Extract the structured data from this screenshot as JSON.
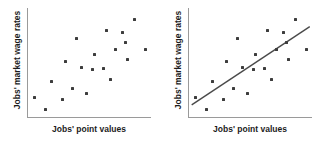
{
  "figure": {
    "background_color": "#ffffff",
    "axis_color": "#9a9a9a",
    "marker_color": "#3d3d3d",
    "trendline_color": "#4a4a4a"
  },
  "panels": [
    {
      "name": "scatter-without-trendline",
      "xlabel": "Jobs' point values",
      "ylabel": "Jobs' market wage rates",
      "has_trendline": false
    },
    {
      "name": "scatter-with-trendline",
      "xlabel": "Jobs' point values",
      "ylabel": "Jobs' market wage rates",
      "has_trendline": true
    }
  ],
  "chart_data": [
    {
      "type": "scatter",
      "title": "",
      "xlabel": "Jobs' point values",
      "ylabel": "Jobs' market wage rates",
      "xlim": [
        0,
        100
      ],
      "ylim": [
        0,
        100
      ],
      "grid": false,
      "legend": "none",
      "axis_ticks": false,
      "trendline": null,
      "points": [
        {
          "x": 6,
          "y": 19
        },
        {
          "x": 15,
          "y": 8
        },
        {
          "x": 20,
          "y": 33
        },
        {
          "x": 29,
          "y": 17
        },
        {
          "x": 31,
          "y": 51
        },
        {
          "x": 37,
          "y": 27
        },
        {
          "x": 40,
          "y": 72
        },
        {
          "x": 44,
          "y": 46
        },
        {
          "x": 48,
          "y": 22
        },
        {
          "x": 53,
          "y": 44
        },
        {
          "x": 55,
          "y": 58
        },
        {
          "x": 62,
          "y": 45
        },
        {
          "x": 65,
          "y": 80
        },
        {
          "x": 68,
          "y": 35
        },
        {
          "x": 72,
          "y": 62
        },
        {
          "x": 78,
          "y": 78
        },
        {
          "x": 80,
          "y": 69
        },
        {
          "x": 82,
          "y": 53
        },
        {
          "x": 87,
          "y": 90
        },
        {
          "x": 96,
          "y": 62
        }
      ]
    },
    {
      "type": "scatter",
      "title": "",
      "xlabel": "Jobs' point values",
      "ylabel": "Jobs' market wage rates",
      "xlim": [
        0,
        100
      ],
      "ylim": [
        0,
        100
      ],
      "grid": false,
      "legend": "none",
      "axis_ticks": false,
      "trendline": {
        "label": "fitted regression line",
        "x_start": 3,
        "y_start": 12,
        "x_end": 99,
        "y_end": 83
      },
      "points": [
        {
          "x": 6,
          "y": 19
        },
        {
          "x": 15,
          "y": 8
        },
        {
          "x": 20,
          "y": 33
        },
        {
          "x": 29,
          "y": 17
        },
        {
          "x": 31,
          "y": 51
        },
        {
          "x": 37,
          "y": 27
        },
        {
          "x": 40,
          "y": 72
        },
        {
          "x": 44,
          "y": 46
        },
        {
          "x": 48,
          "y": 22
        },
        {
          "x": 53,
          "y": 44
        },
        {
          "x": 55,
          "y": 58
        },
        {
          "x": 62,
          "y": 45
        },
        {
          "x": 65,
          "y": 80
        },
        {
          "x": 68,
          "y": 35
        },
        {
          "x": 72,
          "y": 62
        },
        {
          "x": 78,
          "y": 78
        },
        {
          "x": 80,
          "y": 69
        },
        {
          "x": 82,
          "y": 53
        },
        {
          "x": 87,
          "y": 90
        },
        {
          "x": 96,
          "y": 62
        }
      ]
    }
  ]
}
